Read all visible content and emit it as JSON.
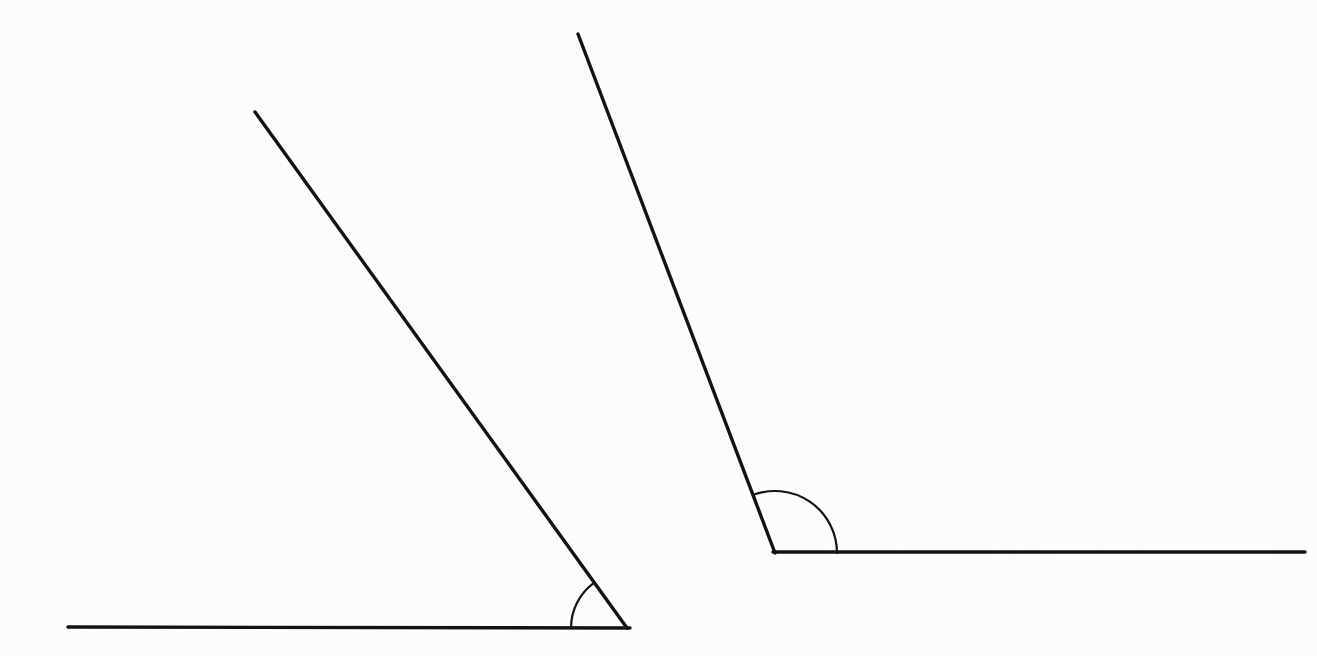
{
  "figure": {
    "background_color": "#fdfdfd",
    "stroke_color": "#111111",
    "canvas": {
      "width": 1317,
      "height": 656
    },
    "line_width": 3.4,
    "arc_line_width": 2.2
  },
  "chart_data": {
    "type": "diagram",
    "xlabel": "",
    "ylabel": "",
    "xlim": [
      0,
      1317
    ],
    "ylim": [
      0,
      656
    ],
    "grid": false,
    "legend": "none",
    "shapes": [
      {
        "name": "acute-angle",
        "label": "Left angle (acute)",
        "vertex": [
          627,
          628
        ],
        "measure_degrees": 54,
        "arc_radius": 56,
        "rays": [
          {
            "name": "horizontal-ray",
            "from": [
              68,
              627
            ],
            "to": [
              630,
              628
            ],
            "direction_degrees": 180
          },
          {
            "name": "slanted-ray",
            "from": [
              627,
              628
            ],
            "to": [
              255,
              112
            ],
            "direction_degrees": 125.8
          }
        ]
      },
      {
        "name": "obtuse-angle",
        "label": "Right angle (obtuse)",
        "vertex": [
          775,
          553
        ],
        "measure_degrees": 111,
        "arc_radius": 62,
        "rays": [
          {
            "name": "horizontal-ray",
            "from": [
              773,
              552
            ],
            "to": [
              1305,
              552
            ],
            "direction_degrees": 0
          },
          {
            "name": "slanted-ray",
            "from": [
              775,
              553
            ],
            "to": [
              578,
              34
            ],
            "direction_degrees": 110.8
          }
        ]
      }
    ]
  }
}
